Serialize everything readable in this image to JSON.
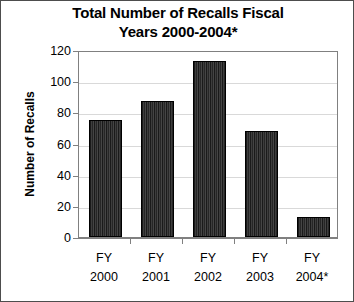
{
  "chart_data": {
    "type": "bar",
    "title": "Total Number of Recalls Fiscal Years 2000-2004*",
    "title_line1": "Total Number of Recalls Fiscal",
    "title_line2": "Years 2000-2004*",
    "xlabel": "",
    "ylabel": "Number of Recalls",
    "categories": [
      "FY 2000",
      "FY 2001",
      "FY 2002",
      "FY 2003",
      "FY 2004*"
    ],
    "category_lines": [
      {
        "line1": "FY",
        "line2": "2000"
      },
      {
        "line1": "FY",
        "line2": "2001"
      },
      {
        "line1": "FY",
        "line2": "2002"
      },
      {
        "line1": "FY",
        "line2": "2003"
      },
      {
        "line1": "FY",
        "line2": "2004*"
      }
    ],
    "values": [
      75,
      87,
      113,
      68,
      13
    ],
    "ylim": [
      0,
      120
    ],
    "yticks": [
      0,
      20,
      40,
      60,
      80,
      100,
      120
    ],
    "ytick_labels": [
      "0",
      "20",
      "40",
      "60",
      "80",
      "100",
      "120"
    ],
    "grid": true,
    "legend": null,
    "bar_color": "#2b2b2b",
    "gridline_color": "#d9d9d9",
    "axis_color": "#808080",
    "text_color": "#000000",
    "background_color": "#ffffff"
  }
}
